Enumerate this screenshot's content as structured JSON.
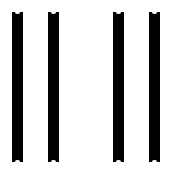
{
  "figure": {
    "background": "#ffffff",
    "bar_color": "#000000",
    "bars": [
      {
        "left": 12,
        "width": 11
      },
      {
        "left": 48,
        "width": 11
      },
      {
        "left": 113,
        "width": 11
      },
      {
        "left": 149,
        "width": 11
      }
    ],
    "bar_top": 12,
    "bar_height": 150
  }
}
